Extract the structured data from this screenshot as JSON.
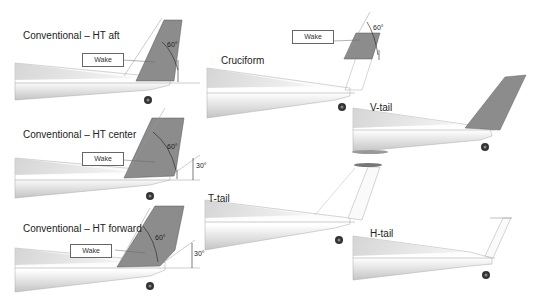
{
  "panels": [
    {
      "id": "conv-aft",
      "title": "Conventional – HT aft",
      "wake_label": "Wake",
      "angles": [
        "60°"
      ]
    },
    {
      "id": "conv-center",
      "title": "Conventional – HT center",
      "wake_label": "Wake",
      "angles": [
        "60°",
        "30°"
      ]
    },
    {
      "id": "conv-forward",
      "title": "Conventional – HT forward",
      "wake_label": "Wake",
      "angles": [
        "60°",
        "30°"
      ]
    },
    {
      "id": "cruciform",
      "title": "Cruciform",
      "wake_label": "Wake",
      "angles": [
        "60°"
      ]
    },
    {
      "id": "t-tail",
      "title": "T-tail"
    },
    {
      "id": "v-tail",
      "title": "V-tail"
    },
    {
      "id": "h-tail",
      "title": "H-tail"
    }
  ],
  "colors": {
    "shaded_area": "#8c8c8c",
    "outline": "#555555",
    "fuselage_dark": "#b8b8b8"
  }
}
